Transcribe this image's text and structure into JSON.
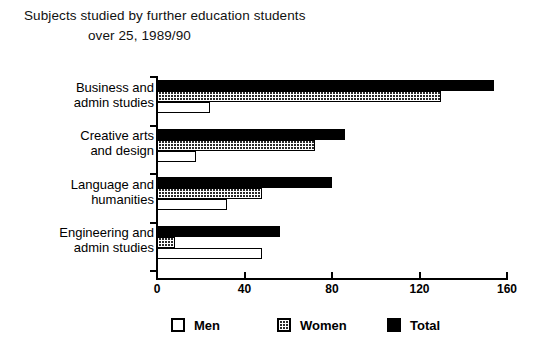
{
  "chart_data": {
    "type": "bar",
    "orientation": "horizontal",
    "title": "Subjects studied by further education students over 25, 1989/90",
    "title_lines": [
      "Subjects studied by further education students",
      "over 25, 1989/90"
    ],
    "xlabel": "",
    "ylabel": "",
    "xlim": [
      0,
      160
    ],
    "xticks": [
      0,
      40,
      80,
      120,
      160
    ],
    "xtick_labels": [
      "0",
      "40",
      "80",
      "120",
      "160"
    ],
    "grid": false,
    "legend_position": "bottom",
    "categories": [
      "Business and\nadmin studies",
      "Creative arts\nand design",
      "Language and\nhumanities",
      "Engineering and\nadmin studies"
    ],
    "series": [
      {
        "name": "Total",
        "pattern": "solid-black",
        "color": "#000000",
        "values": [
          154,
          86,
          80,
          56
        ]
      },
      {
        "name": "Women",
        "pattern": "checkered",
        "color": "#2a2a2a",
        "values": [
          130,
          72,
          48,
          8
        ]
      },
      {
        "name": "Men",
        "pattern": "white-outline",
        "color": "#ffffff",
        "values": [
          24,
          18,
          32,
          48
        ]
      }
    ]
  },
  "legend": {
    "items": [
      {
        "label": "Men",
        "swatch": "white-outline"
      },
      {
        "label": "Women",
        "swatch": "checkered"
      },
      {
        "label": "Total",
        "swatch": "solid-black"
      }
    ]
  }
}
